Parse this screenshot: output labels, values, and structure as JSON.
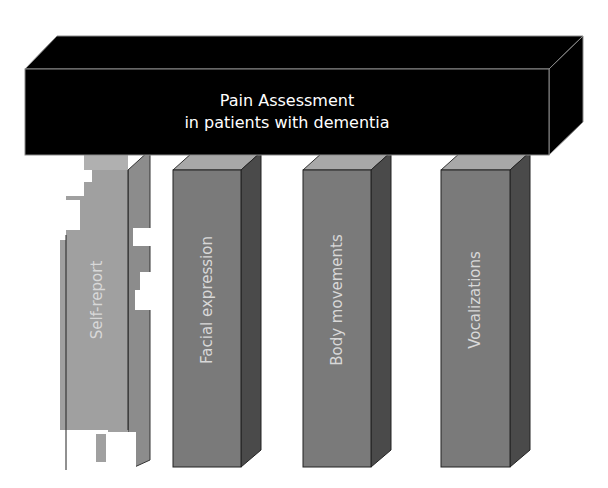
{
  "diagram": {
    "title_line1": "Pain Assessment",
    "title_line2": "in patients with dementia",
    "pillars": [
      {
        "label": "Self-report",
        "style": "broken"
      },
      {
        "label": "Facial expression",
        "style": "solid"
      },
      {
        "label": "Body movements",
        "style": "solid"
      },
      {
        "label": "Vocalizations",
        "style": "solid"
      }
    ],
    "colors": {
      "beam": "#000000",
      "beam_edge": "#8a8a8a",
      "pillar_front": "#7a7a7a",
      "pillar_top": "#a8a8a8",
      "pillar_side": "#4a4a4a",
      "broken_front": "#a0a0a0",
      "broken_side": "#8a8a8a",
      "label": "#d8d8d8"
    }
  }
}
